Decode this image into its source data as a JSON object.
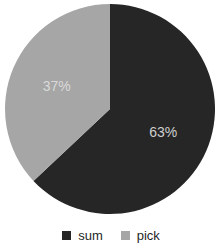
{
  "chart_data": {
    "type": "pie",
    "categories": [
      "sum",
      "pick"
    ],
    "values": [
      63,
      37
    ],
    "slice_labels": [
      "63%",
      "37%"
    ],
    "colors": [
      "#262626",
      "#a6a6a6"
    ],
    "label_text_colors": [
      "#cfcfcf",
      "#d9d9d9"
    ],
    "start_angle_deg": 0,
    "direction": "clockwise",
    "title": "",
    "legend_position": "bottom",
    "legend": [
      {
        "label": "sum",
        "color": "#262626"
      },
      {
        "label": "pick",
        "color": "#a6a6a6"
      }
    ],
    "background": "#ffffff",
    "geometry": {
      "cx": 110,
      "cy": 109,
      "r": 105,
      "label_radius": 58
    }
  }
}
